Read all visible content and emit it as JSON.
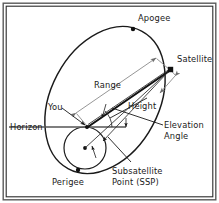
{
  "figure": {
    "name": "satellite-orbit-geometry",
    "background_color": "#ffffff",
    "line_color": "#1a1a1a",
    "dimension_color": "#8a8a8a",
    "horizon_color": "#555555",
    "frame_color": "#5a5a5a"
  },
  "labels": {
    "apogee": "Apogee",
    "satellite": "Satellite",
    "range": "Range",
    "you": "You",
    "horizon": "Horizon",
    "height": "Height",
    "elevation_angle_line1": "Elevation",
    "elevation_angle_line2": "Angle",
    "perigee": "Perigee",
    "ssp_line1": "Subsatellite",
    "ssp_line2": "Point (SSP)"
  },
  "geometry": {
    "orbit": {
      "type": "ellipse",
      "center_x": 105,
      "center_y": 100,
      "radius_x": 54,
      "radius_y": 78,
      "rotation_deg": 28
    },
    "earth": {
      "type": "circle",
      "center_x": 85,
      "center_y": 148,
      "radius": 21
    },
    "points": {
      "apogee": {
        "x": 133,
        "y": 29
      },
      "perigee": {
        "x": 78,
        "y": 170
      },
      "satellite": {
        "x": 171,
        "y": 70
      },
      "observer": {
        "x": 87,
        "y": 127
      },
      "earth_center": {
        "x": 85,
        "y": 148
      },
      "ssp": {
        "x": 103,
        "y": 141
      }
    },
    "horizon_y": 127,
    "horizon_x_start": 9,
    "horizon_x_end": 126
  }
}
